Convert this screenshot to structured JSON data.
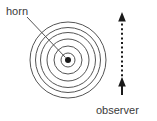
{
  "figure": {
    "type": "wavefront-diagram",
    "background_color": "#ffffff",
    "stroke_color": "#555555",
    "text_color": "#3a3a3a"
  },
  "labels": {
    "source": "horn",
    "observer": "observer"
  },
  "source": {
    "name": "horn",
    "center_x": 68,
    "center_y": 60,
    "dot_radius": 3,
    "dot_color": "#1a1a1a"
  },
  "wavefronts": {
    "name": "concentric-circles",
    "count": 6,
    "radii": [
      7,
      14,
      22,
      29,
      30.5,
      38
    ],
    "stroke_width": 1
  },
  "leader_line": {
    "name": "horn-leader-line",
    "x1": 27,
    "y1": 17,
    "x2": 65,
    "y2": 57
  },
  "observer_arrow": {
    "name": "observer-path-arrow",
    "x": 122,
    "y_top": 14,
    "y_bottom": 92,
    "style": "dotted",
    "heads": "both",
    "direction": "vertical"
  },
  "label_positions": {
    "horn": {
      "x": 6,
      "y": 14
    },
    "observer": {
      "x": 97,
      "y": 112
    }
  }
}
